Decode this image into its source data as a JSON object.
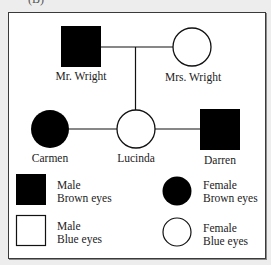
{
  "figure": {
    "panel_label": "(B)",
    "type": "pedigree"
  },
  "individuals": [
    {
      "id": "mr_wright",
      "name": "Mr. Wright",
      "sex": "male",
      "eye_color": "brown",
      "symbol": "filled-square"
    },
    {
      "id": "mrs_wright",
      "name": "Mrs. Wright",
      "sex": "female",
      "eye_color": "blue",
      "symbol": "empty-circle"
    },
    {
      "id": "carmen",
      "name": "Carmen",
      "sex": "female",
      "eye_color": "brown",
      "symbol": "filled-circle"
    },
    {
      "id": "lucinda",
      "name": "Lucinda",
      "sex": "female",
      "eye_color": "blue",
      "symbol": "empty-circle"
    },
    {
      "id": "darren",
      "name": "Darren",
      "sex": "male",
      "eye_color": "brown",
      "symbol": "filled-square"
    }
  ],
  "relationships": [
    {
      "type": "mating",
      "between": [
        "mr_wright",
        "mrs_wright"
      ]
    },
    {
      "type": "offspring",
      "parents": [
        "mr_wright",
        "mrs_wright"
      ],
      "child": "lucinda"
    },
    {
      "type": "connection",
      "between": [
        "carmen",
        "lucinda"
      ]
    },
    {
      "type": "mating",
      "between": [
        "lucinda",
        "darren"
      ]
    }
  ],
  "labels": {
    "mr_wright": "Mr. Wright",
    "mrs_wright": "Mrs. Wright",
    "carmen": "Carmen",
    "lucinda": "Lucinda",
    "darren": "Darren"
  },
  "legend": {
    "items": [
      {
        "symbol": "filled-square",
        "line1": "Male",
        "line2": "Brown eyes"
      },
      {
        "symbol": "empty-square",
        "line1": "Male",
        "line2": "Blue eyes"
      },
      {
        "symbol": "filled-circle",
        "line1": "Female",
        "line2": "Brown eyes"
      },
      {
        "symbol": "empty-circle",
        "line1": "Female",
        "line2": "Blue eyes"
      }
    ]
  },
  "colors": {
    "symbol_fill": "#000000",
    "line": "#111111",
    "frame_border": "#3a3a3a",
    "background": "#ededed",
    "frame_background": "#ffffff"
  }
}
